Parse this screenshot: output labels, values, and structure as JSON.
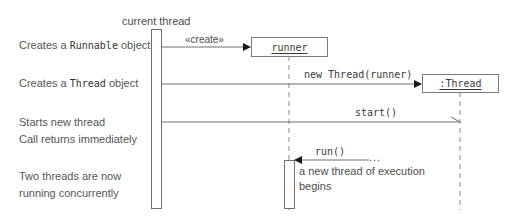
{
  "colors": {
    "line": "#6e6e6e",
    "text": "#4d4d4d",
    "background": "#ffffff"
  },
  "lifelines": {
    "current_thread": {
      "label": "current thread"
    },
    "runner": {
      "label": "runner"
    },
    "thread": {
      "label": ":Thread"
    }
  },
  "descriptions": [
    {
      "prefix": "Creates a ",
      "code": "Runnable",
      "suffix": " object"
    },
    {
      "prefix": "Creates a ",
      "code": "Thread",
      "suffix": " object"
    },
    {
      "line1": "Starts new thread",
      "line2": "Call returns immediately"
    },
    {
      "line1": "Two threads are now",
      "line2": "running concurrently"
    }
  ],
  "messages": [
    {
      "label": "«create»",
      "from": "current_thread",
      "to": "runner"
    },
    {
      "label": "new Thread(runner)",
      "from": "current_thread",
      "to": "thread"
    },
    {
      "label": "start()",
      "from": "current_thread",
      "to": "thread"
    },
    {
      "label": "run()",
      "from": "...",
      "to": "runner",
      "origin_marker": "..."
    }
  ],
  "annotations": {
    "new_thread_note_line1": "a new thread of execution",
    "new_thread_note_line2": "begins"
  }
}
